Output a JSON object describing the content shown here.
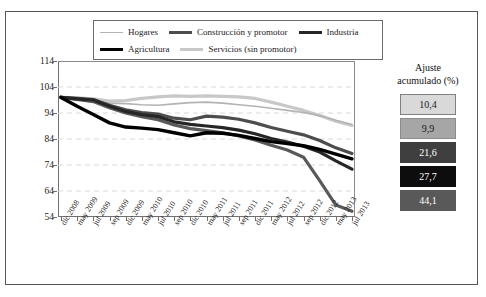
{
  "legend": {
    "items": [
      {
        "label": "Hogares",
        "color": "#b3b3b3",
        "width": 1.6
      },
      {
        "label": "Construcción y promotor",
        "color": "#4d4d4d",
        "width": 3.2
      },
      {
        "label": "Industria",
        "color": "#262626",
        "width": 3.2
      },
      {
        "label": "Agricultura",
        "color": "#000000",
        "width": 3.4
      },
      {
        "label": "Servicios (sin promotor)",
        "color": "#c8c8c8",
        "width": 3.2
      }
    ]
  },
  "side_panel": {
    "title_line1": "Ajuste",
    "title_line2": "acumulado (%)",
    "boxes": [
      {
        "value": "10,4",
        "bg": "#d9d9d9",
        "fg": "#1a1a1a",
        "border": "#808080"
      },
      {
        "value": "9,9",
        "bg": "#a6a6a6",
        "fg": "#1a1a1a",
        "border": "#8c8c8c"
      },
      {
        "value": "21,6",
        "bg": "#3f3f3f",
        "fg": "#ffffff",
        "border": "#3f3f3f"
      },
      {
        "value": "27,7",
        "bg": "#0d0d0d",
        "fg": "#ffffff",
        "border": "#0d0d0d"
      },
      {
        "value": "44,1",
        "bg": "#595959",
        "fg": "#ffffff",
        "border": "#595959"
      }
    ]
  },
  "chart_data": {
    "type": "line",
    "title": "",
    "xlabel": "",
    "ylabel": "",
    "ylim": [
      54,
      114
    ],
    "yticks": [
      114,
      104,
      94,
      84,
      74,
      64,
      54
    ],
    "grid": true,
    "legend_position": "top",
    "categories": [
      "dic 2008",
      "may 2009",
      "jul 2009",
      "sep 2009",
      "dic 2009",
      "may 2010",
      "jul 2010",
      "sep 2010",
      "dic 2010",
      "may 2011",
      "jul 2011",
      "sep 2011",
      "dic 2011",
      "may 2012",
      "jul 2012",
      "sep 2012",
      "dic 2012",
      "may 2013",
      "jul 2013"
    ],
    "series": [
      {
        "name": "Hogares",
        "color": "#b3b3b3",
        "width": 1.6,
        "values": [
          100.0,
          99.0,
          98.6,
          97.8,
          97.6,
          97.2,
          97.0,
          97.5,
          98.0,
          98.2,
          97.8,
          97.2,
          96.6,
          95.8,
          95.0,
          94.2,
          93.0,
          91.2,
          89.6
        ]
      },
      {
        "name": "Construcción y promotor",
        "color": "#4d4d4d",
        "width": 3.2,
        "values": [
          100.0,
          99.6,
          99.2,
          97.0,
          95.2,
          94.2,
          93.6,
          92.0,
          91.4,
          92.8,
          92.4,
          91.6,
          90.2,
          88.4,
          87.0,
          85.6,
          83.4,
          80.6,
          78.4
        ]
      },
      {
        "name": "Industria",
        "color": "#262626",
        "width": 3.2,
        "values": [
          100.0,
          99.4,
          99.0,
          96.6,
          94.6,
          93.4,
          92.6,
          90.6,
          89.6,
          89.0,
          88.4,
          87.4,
          86.0,
          84.2,
          82.8,
          81.2,
          79.0,
          75.6,
          72.4
        ]
      },
      {
        "name": "Agricultura",
        "color": "#000000",
        "width": 3.4,
        "values": [
          100.0,
          96.6,
          93.4,
          90.2,
          88.6,
          88.2,
          87.6,
          86.4,
          85.2,
          86.4,
          86.2,
          85.4,
          84.2,
          83.0,
          82.2,
          81.4,
          80.0,
          78.2,
          76.4
        ]
      },
      {
        "name": "Servicios (sin promotor)",
        "color": "#c8c8c8",
        "width": 3.2,
        "values": [
          100.0,
          99.8,
          99.4,
          98.6,
          98.8,
          99.6,
          100.2,
          100.6,
          100.4,
          100.6,
          100.4,
          100.2,
          99.6,
          98.2,
          96.6,
          95.0,
          93.0,
          90.8,
          89.2
        ]
      }
    ],
    "drop_series": {
      "name": "Servicios ajuste",
      "color": "#595959",
      "width": 3.2,
      "values": [
        100.0,
        99.2,
        98.4,
        96.0,
        94.0,
        92.6,
        91.4,
        89.4,
        88.0,
        87.2,
        86.4,
        85.2,
        83.6,
        81.6,
        79.8,
        77.0,
        68.0,
        58.6,
        56.2
      ]
    }
  }
}
